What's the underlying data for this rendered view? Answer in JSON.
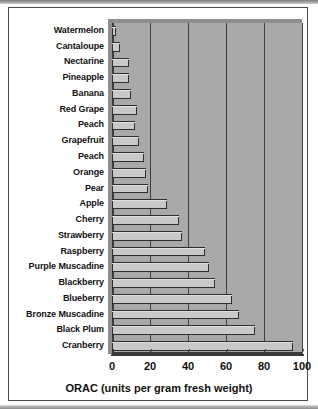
{
  "chart_data": {
    "type": "bar",
    "orientation": "horizontal",
    "title": "",
    "xlabel": "ORAC (units per gram fresh weight)",
    "ylabel": "",
    "xlim": [
      0,
      100
    ],
    "xticks": [
      0,
      20,
      40,
      60,
      80,
      100
    ],
    "grid": true,
    "legend": null,
    "categories": [
      "Watermelon",
      "Cantaloupe",
      "Nectarine",
      "Pineapple",
      "Banana",
      "Red Grape",
      "Peach",
      "Grapefruit",
      "Peach",
      "Orange",
      "Pear",
      "Apple",
      "Cherry",
      "Strawberry",
      "Raspberry",
      "Purple Muscadine",
      "Blackberry",
      "Blueberry",
      "Bronze Muscadine",
      "Black Plum",
      "Cranberry"
    ],
    "values": [
      2,
      4,
      9,
      9,
      10,
      13,
      12,
      14,
      17,
      18,
      19,
      29,
      35,
      37,
      49,
      51,
      54,
      63,
      67,
      75,
      95
    ],
    "colors": {
      "bar_fill": "#c9c9c9",
      "bar_edge": "#2e2e2e",
      "plot_background": "#a9a9a9",
      "gridline": "#3f3f3f",
      "figure_background": "#ffffff",
      "text": "#111111"
    }
  },
  "axis": {
    "tick_labels": [
      "0",
      "20",
      "40",
      "60",
      "80",
      "100"
    ],
    "x_title": "ORAC (units per gram fresh weight)"
  }
}
